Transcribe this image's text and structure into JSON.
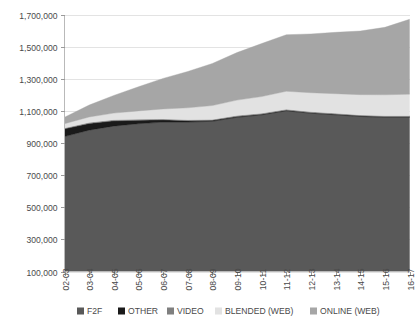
{
  "chart_data": {
    "type": "area",
    "stacked": true,
    "title": "",
    "subtitle": "",
    "xlabel": "",
    "ylabel": "",
    "grid": true,
    "legend_position": "bottom",
    "ylim": [
      100000,
      1700000
    ],
    "ytick_step": 200000,
    "ytick_labels": [
      "1,700,000",
      "1,500,000",
      "1,300,000",
      "1,100,000",
      "900,000",
      "700,000",
      "500,000",
      "300,000",
      "100,000"
    ],
    "ytick_values": [
      1700000,
      1500000,
      1300000,
      1100000,
      900000,
      700000,
      500000,
      300000,
      100000
    ],
    "categories": [
      "02-03",
      "03-04",
      "04-05",
      "05-06",
      "06-07",
      "07-08",
      "08-09",
      "09-10",
      "10-11",
      "11-12",
      "12-13",
      "13-14",
      "14-15",
      "15-16",
      "16-17"
    ],
    "series": [
      {
        "name": "F2F",
        "color": "#595959",
        "values": [
          840000,
          880000,
          905000,
          920000,
          930000,
          930000,
          935000,
          960000,
          975000,
          1000000,
          985000,
          975000,
          965000,
          960000,
          960000
        ]
      },
      {
        "name": "OTHER",
        "color": "#1a1a1a",
        "values": [
          48000,
          42000,
          33000,
          22000,
          14000,
          9000,
          6000,
          5000,
          4000,
          4000,
          4000,
          4000,
          4000,
          4000,
          4000
        ]
      },
      {
        "name": "VIDEO",
        "color": "#7f7f7f",
        "values": [
          6000,
          6000,
          6000,
          6000,
          6000,
          6000,
          6000,
          6000,
          6000,
          6000,
          6000,
          6000,
          6000,
          6000,
          6000
        ]
      },
      {
        "name": "BLENDED (WEB)",
        "color": "#e2e2e2",
        "values": [
          26000,
          34000,
          42000,
          52000,
          62000,
          74000,
          86000,
          96000,
          104000,
          112000,
          118000,
          122000,
          126000,
          130000,
          134000
        ]
      },
      {
        "name": "ONLINE (WEB)",
        "color": "#a6a6a6",
        "values": [
          40000,
          74000,
          110000,
          150000,
          190000,
          226000,
          262000,
          296000,
          330000,
          352000,
          366000,
          382000,
          396000,
          420000,
          466000
        ]
      }
    ],
    "stack_totals": [
      960000,
      1036000,
      1096000,
      1150000,
      1202000,
      1245000,
      1295000,
      1363000,
      1419000,
      1474000,
      1479000,
      1489000,
      1497000,
      1520000,
      1570000
    ],
    "legend_entries": [
      {
        "label": "F2F",
        "color": "#595959"
      },
      {
        "label": "OTHER",
        "color": "#1a1a1a"
      },
      {
        "label": "VIDEO",
        "color": "#7f7f7f"
      },
      {
        "label": "BLENDED (WEB)",
        "color": "#e2e2e2"
      },
      {
        "label": "ONLINE (WEB)",
        "color": "#a6a6a6"
      }
    ]
  },
  "colors": {
    "background": "#ffffff",
    "gridline": "#e3e3e3",
    "axis": "#b9b9b9",
    "text": "#4a4a4a"
  }
}
